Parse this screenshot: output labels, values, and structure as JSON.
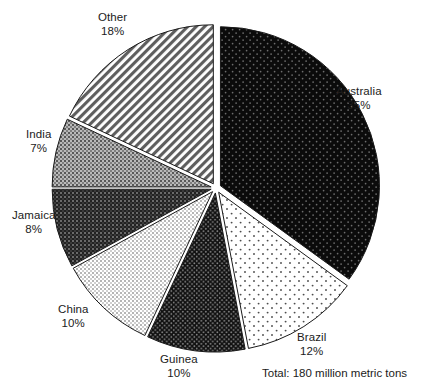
{
  "chart_data": {
    "type": "pie",
    "title": "",
    "subtitle": "",
    "xlabel": "",
    "ylabel": "",
    "grid": false,
    "legend_position": "outside-labels",
    "annotation": "Total: 180 million metric tons",
    "start_angle_deg": 0,
    "direction": "clockwise",
    "exploded": true,
    "categories": [
      "Australia",
      "Brazil",
      "Guinea",
      "China",
      "Jamaica",
      "India",
      "Other"
    ],
    "values": [
      35,
      12,
      10,
      10,
      8,
      7,
      18
    ],
    "value_unit": "%",
    "total_value": 100,
    "slices": [
      {
        "name": "Australia",
        "value": 35,
        "value_label": "35%",
        "fill": "black-fine-dots",
        "base_color": "#0b0b0b",
        "label_x": 336,
        "label_y": 84
      },
      {
        "name": "Brazil",
        "value": 12,
        "value_label": "12%",
        "fill": "white-sparse-dots",
        "base_color": "#ffffff",
        "label_x": 297,
        "label_y": 330
      },
      {
        "name": "Guinea",
        "value": 10,
        "value_label": "10%",
        "fill": "black-dense-dots",
        "base_color": "#141414",
        "label_x": 160,
        "label_y": 352
      },
      {
        "name": "China",
        "value": 10,
        "value_label": "10%",
        "fill": "light-gray-checker",
        "base_color": "#e8e8e8",
        "label_x": 58,
        "label_y": 302
      },
      {
        "name": "Jamaica",
        "value": 8,
        "value_label": "8%",
        "fill": "dark-gray-checker",
        "base_color": "#3d3d3d",
        "label_x": 12,
        "label_y": 208
      },
      {
        "name": "India",
        "value": 7,
        "value_label": "7%",
        "fill": "mid-gray-checker",
        "base_color": "#8a8a8a",
        "label_x": 26,
        "label_y": 127
      },
      {
        "name": "Other",
        "value": 18,
        "value_label": "18%",
        "fill": "diagonal-hatch",
        "base_color": "#ffffff",
        "label_x": 98,
        "label_y": 10
      }
    ],
    "geometry": {
      "center_x": 216,
      "center_y": 188,
      "radius": 159,
      "explode_offset": 5
    }
  },
  "footer": {
    "total_label": "Total: 180 million metric tons",
    "total_x": 262,
    "total_y": 366
  }
}
